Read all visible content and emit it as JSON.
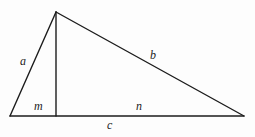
{
  "figure": {
    "kind": "geometry-diagram",
    "background_color": "#fdfdfd",
    "stroke_color": "#1c1c1c",
    "stroke_width": 1.4,
    "vertices": {
      "apex": {
        "x": 56,
        "y": 12
      },
      "bottom_left": {
        "x": 10,
        "y": 116
      },
      "bottom_right": {
        "x": 244,
        "y": 116
      },
      "altitude_foot": {
        "x": 56,
        "y": 116
      }
    },
    "segments": [
      {
        "name": "side-a",
        "from": "apex",
        "to": "bottom_left"
      },
      {
        "name": "side-b",
        "from": "apex",
        "to": "bottom_right"
      },
      {
        "name": "side-c-base",
        "from": "bottom_left",
        "to": "bottom_right"
      },
      {
        "name": "altitude",
        "from": "apex",
        "to": "altitude_foot"
      }
    ],
    "labels": {
      "a": "a",
      "b": "b",
      "m": "m",
      "n": "n",
      "c": "c"
    }
  }
}
